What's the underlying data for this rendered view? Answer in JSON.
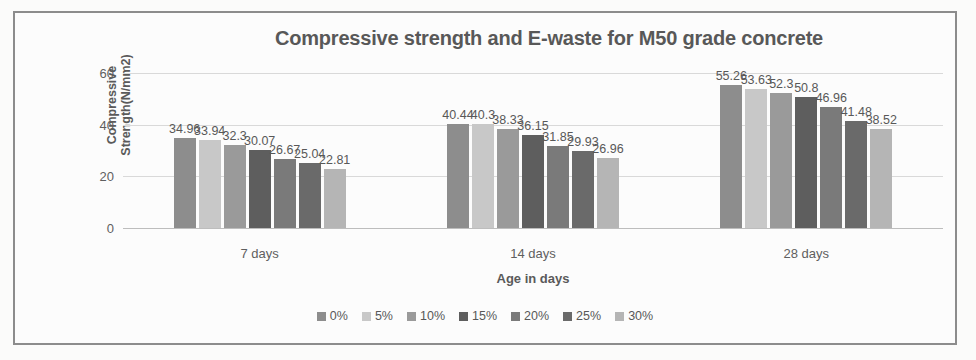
{
  "chart_data": {
    "type": "bar",
    "title": "Compressive strength and E-waste for M50 grade concrete",
    "xlabel": "Age in days",
    "ylabel": "Compressive Strength(N/mm2)",
    "categories": [
      "7 days",
      "14 days",
      "28 days"
    ],
    "ylim": [
      0,
      60
    ],
    "yticks": [
      0,
      20,
      40,
      60
    ],
    "grid": true,
    "legend_position": "bottom",
    "series": [
      {
        "name": "0%",
        "color": "#8d8d8d",
        "values": [
          34.96,
          40.44,
          55.26
        ]
      },
      {
        "name": "5%",
        "color": "#c8c8c8",
        "values": [
          33.94,
          40.3,
          53.63
        ]
      },
      {
        "name": "10%",
        "color": "#9a9a9a",
        "values": [
          32.3,
          38.33,
          52.3
        ]
      },
      {
        "name": "15%",
        "color": "#5e5e5e",
        "values": [
          30.07,
          36.15,
          50.8
        ]
      },
      {
        "name": "20%",
        "color": "#7a7a7a",
        "values": [
          26.67,
          31.85,
          46.96
        ]
      },
      {
        "name": "25%",
        "color": "#6a6a6a",
        "values": [
          25.04,
          29.93,
          41.48
        ]
      },
      {
        "name": "30%",
        "color": "#b5b5b5",
        "values": [
          22.81,
          26.96,
          38.52
        ]
      }
    ]
  },
  "frame": {
    "border_color": "#8c8c8c",
    "title_color": "#585858"
  }
}
